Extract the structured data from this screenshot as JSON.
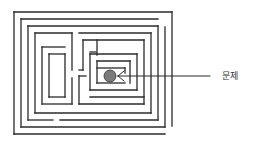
{
  "diagram": {
    "type": "maze",
    "label": "문제",
    "colors": {
      "line": "#2a2a2a",
      "goal_fill": "#7a7a7a",
      "background": "#ffffff"
    },
    "goal": {
      "cx": 110,
      "cy": 76,
      "r": 6
    },
    "pointer": {
      "x1": 118,
      "y1": 76,
      "x2": 210,
      "y2": 76
    },
    "walls": [
      [
        14,
        12,
        172,
        12
      ],
      [
        14,
        12,
        14,
        134
      ],
      [
        14,
        134,
        165,
        134
      ],
      [
        172,
        12,
        172,
        126
      ],
      [
        21,
        19,
        158,
        19
      ],
      [
        21,
        19,
        21,
        127
      ],
      [
        21,
        127,
        165,
        127
      ],
      [
        165,
        27,
        165,
        127
      ],
      [
        28,
        26,
        158,
        26
      ],
      [
        28,
        26,
        28,
        120
      ],
      [
        28,
        120,
        53,
        120
      ],
      [
        60,
        120,
        158,
        120
      ],
      [
        158,
        26,
        158,
        120
      ],
      [
        35,
        33,
        72,
        33
      ],
      [
        35,
        33,
        35,
        113
      ],
      [
        35,
        113,
        151,
        113
      ],
      [
        151,
        33,
        151,
        113
      ],
      [
        79,
        33,
        151,
        33
      ],
      [
        42,
        47,
        65,
        47
      ],
      [
        42,
        47,
        42,
        104
      ],
      [
        42,
        104,
        72,
        104
      ],
      [
        72,
        33,
        72,
        70
      ],
      [
        72,
        78,
        72,
        104
      ],
      [
        49,
        54,
        65,
        54
      ],
      [
        49,
        54,
        49,
        97
      ],
      [
        49,
        97,
        65,
        97
      ],
      [
        65,
        54,
        65,
        97
      ],
      [
        79,
        76,
        79,
        104
      ],
      [
        79,
        104,
        144,
        104
      ],
      [
        144,
        40,
        144,
        104
      ],
      [
        83,
        40,
        144,
        40
      ],
      [
        83,
        40,
        83,
        70
      ],
      [
        79,
        70,
        83,
        70
      ],
      [
        79,
        76,
        86,
        76
      ],
      [
        90,
        52,
        96,
        52
      ],
      [
        97,
        40,
        97,
        55
      ],
      [
        90,
        54,
        137,
        54
      ],
      [
        90,
        54,
        90,
        90
      ],
      [
        90,
        90,
        137,
        90
      ],
      [
        137,
        54,
        137,
        90
      ],
      [
        90,
        97,
        144,
        97
      ],
      [
        97,
        61,
        130,
        61
      ],
      [
        97,
        61,
        97,
        83
      ],
      [
        97,
        83,
        125,
        83
      ],
      [
        130,
        61,
        130,
        83
      ],
      [
        97,
        68,
        125,
        68
      ],
      [
        125,
        68,
        125,
        73
      ]
    ]
  }
}
